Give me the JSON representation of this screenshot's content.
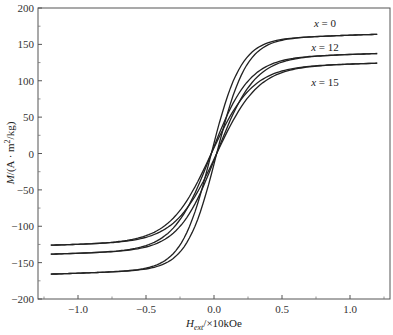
{
  "chart_data": {
    "type": "line",
    "title": "",
    "xlabel": "H_ext/×10kOe",
    "xlabel_main": "H",
    "xlabel_sub": "ext",
    "xlabel_rest": "/×10kOe",
    "ylabel": "M/(A·m²/kg)",
    "xlim": [
      -1.3,
      1.3
    ],
    "ylim": [
      -200,
      200
    ],
    "xticks": [
      -1.0,
      -0.5,
      0.0,
      0.5,
      1.0
    ],
    "xtick_labels": [
      "−1.0",
      "−0.5",
      "0.0",
      "0.5",
      "1.0"
    ],
    "yticks": [
      200,
      150,
      100,
      50,
      0,
      -50,
      -100,
      -150,
      -200
    ],
    "ytick_labels": [
      "200",
      "150",
      "100",
      "50",
      "0",
      "−50",
      "−100",
      "−150",
      "−200"
    ],
    "grid": false,
    "legend": "inline labels",
    "series": [
      {
        "name": "x=0",
        "label": "x = 0",
        "Ms": 161,
        "M_at_min": -163,
        "coercivity": 0.02,
        "shape_k": 4.6,
        "x": [
          -1.2,
          -1.0,
          -0.5,
          -0.3,
          -0.1,
          0.0,
          0.1,
          0.3,
          0.5,
          1.0,
          1.2
        ],
        "values": [
          -163,
          -161,
          -152,
          -115,
          -48,
          -5,
          40,
          110,
          150,
          159,
          161
        ]
      },
      {
        "name": "x=12",
        "label": "x = 12",
        "Ms": 135,
        "M_at_min": -136,
        "coercivity": 0.02,
        "shape_k": 3.6,
        "x": [
          -1.2,
          -1.0,
          -0.5,
          -0.3,
          -0.1,
          0.0,
          0.1,
          0.3,
          0.5,
          1.0,
          1.2
        ],
        "values": [
          -136,
          -133,
          -122,
          -95,
          -42,
          -5,
          35,
          90,
          118,
          131,
          135
        ]
      },
      {
        "name": "x=15",
        "label": "x = 15",
        "Ms": 122,
        "M_at_min": -124,
        "coercivity": 0.02,
        "shape_k": 3.3,
        "x": [
          -1.2,
          -1.0,
          -0.5,
          -0.3,
          -0.1,
          0.0,
          0.1,
          0.3,
          0.5,
          1.0,
          1.2
        ],
        "values": [
          -124,
          -121,
          -110,
          -85,
          -38,
          -5,
          30,
          80,
          105,
          118,
          122
        ]
      }
    ]
  }
}
